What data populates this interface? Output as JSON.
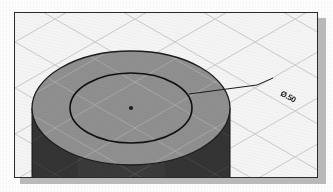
{
  "figure": {
    "type": "cad-isometric-viewport",
    "background_color": "#f4f4f4",
    "border_color": "#2b2b2b",
    "shadow_color": "#b9b9b9"
  },
  "viewport": {
    "x": 14,
    "y": 12,
    "width": 304,
    "height": 166
  },
  "grid": {
    "name": "isometric-grid",
    "line_color": "#c9c9c9",
    "angle_degrees": 30,
    "spacing_px": 23,
    "visible": true
  },
  "solid": {
    "name": "cylinder",
    "top_face_color": "#8f8f8f",
    "side_wall_color": "#3a3a3a",
    "edge_color": "#1c1c1c",
    "top_ellipse": {
      "cx": 136,
      "cy": 95,
      "rx": 99,
      "ry": 57
    },
    "extrude_height_px": 62
  },
  "sketch": {
    "name": "circle-on-top-face",
    "ellipse": {
      "cx": 136,
      "cy": 95,
      "rx": 61,
      "ry": 35
    },
    "line_color": "#101010",
    "center_mark": {
      "cx": 136,
      "cy": 95,
      "size_px": 3,
      "color": "#1c1c1c"
    }
  },
  "leader": {
    "name": "leader-line",
    "color": "#1c1c1c",
    "points": [
      {
        "x": 196,
        "y": 82
      },
      {
        "x": 256,
        "y": 73
      },
      {
        "x": 272,
        "y": 66
      }
    ]
  },
  "annotation": {
    "name": "diameter-dimension",
    "text": "Ø.50",
    "rotation_degrees": 28,
    "color": "#1b1b1b",
    "x": 268,
    "y": 76
  }
}
